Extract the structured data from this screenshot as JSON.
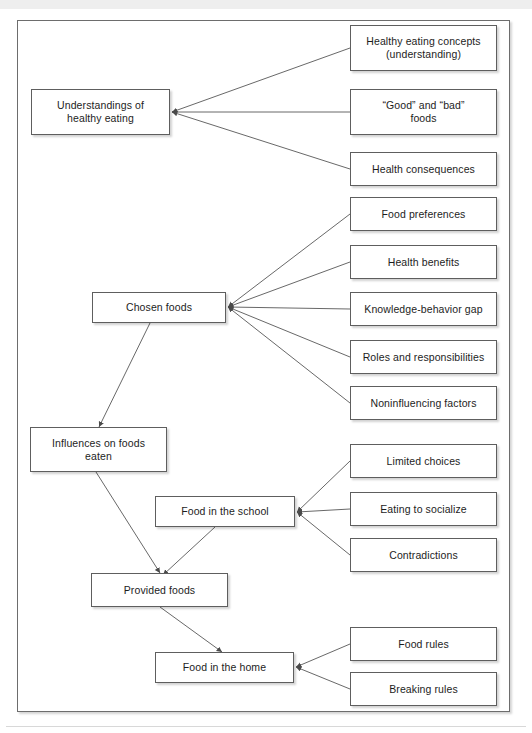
{
  "figure": {
    "type": "hierarchical-concept-map",
    "orientation": "left-parent-to-right-children",
    "arrowheads": "pointing into parent nodes",
    "nodes": [
      {
        "id": "understandings",
        "label": "Understandings of\nhealthy eating",
        "x": 31,
        "y": 89,
        "w": 139,
        "h": 46,
        "level": "theme"
      },
      {
        "id": "concepts",
        "label": "Healthy eating concepts\n(understanding)",
        "x": 350,
        "y": 25,
        "w": 147,
        "h": 46,
        "level": "subtheme"
      },
      {
        "id": "good-bad",
        "label": "“Good” and “bad”\nfoods",
        "x": 350,
        "y": 89,
        "w": 147,
        "h": 46,
        "level": "subtheme"
      },
      {
        "id": "consequences",
        "label": "Health consequences",
        "x": 350,
        "y": 152,
        "w": 147,
        "h": 34,
        "level": "subtheme"
      },
      {
        "id": "chosen-foods",
        "label": "Chosen foods",
        "x": 92,
        "y": 292,
        "w": 134,
        "h": 31,
        "level": "theme"
      },
      {
        "id": "food-preferences",
        "label": "Food preferences",
        "x": 350,
        "y": 197,
        "w": 147,
        "h": 34,
        "level": "subtheme"
      },
      {
        "id": "health-benefits",
        "label": "Health benefits",
        "x": 350,
        "y": 245,
        "w": 147,
        "h": 34,
        "level": "subtheme"
      },
      {
        "id": "knowledge-gap",
        "label": "Knowledge-behavior gap",
        "x": 350,
        "y": 292,
        "w": 147,
        "h": 34,
        "level": "subtheme"
      },
      {
        "id": "roles",
        "label": "Roles and responsibilities",
        "x": 350,
        "y": 340,
        "w": 147,
        "h": 34,
        "level": "subtheme"
      },
      {
        "id": "noninfluencing",
        "label": "Noninfluencing factors",
        "x": 350,
        "y": 386,
        "w": 147,
        "h": 34,
        "level": "subtheme"
      },
      {
        "id": "influences",
        "label": "Influences on foods\neaten",
        "x": 30,
        "y": 427,
        "w": 137,
        "h": 45,
        "level": "theme"
      },
      {
        "id": "food-school",
        "label": "Food in the school",
        "x": 155,
        "y": 496,
        "w": 140,
        "h": 31,
        "level": "theme"
      },
      {
        "id": "limited-choices",
        "label": "Limited choices",
        "x": 350,
        "y": 444,
        "w": 147,
        "h": 34,
        "level": "subtheme"
      },
      {
        "id": "socialize",
        "label": "Eating to socialize",
        "x": 350,
        "y": 492,
        "w": 147,
        "h": 34,
        "level": "subtheme"
      },
      {
        "id": "contradictions",
        "label": "Contradictions",
        "x": 350,
        "y": 538,
        "w": 147,
        "h": 34,
        "level": "subtheme"
      },
      {
        "id": "provided-foods",
        "label": "Provided foods",
        "x": 91,
        "y": 573,
        "w": 137,
        "h": 34,
        "level": "theme"
      },
      {
        "id": "food-home",
        "label": "Food in the home",
        "x": 155,
        "y": 652,
        "w": 139,
        "h": 31,
        "level": "theme"
      },
      {
        "id": "food-rules",
        "label": "Food rules",
        "x": 350,
        "y": 627,
        "w": 147,
        "h": 34,
        "level": "subtheme"
      },
      {
        "id": "breaking-rules",
        "label": "Breaking rules",
        "x": 350,
        "y": 672,
        "w": 147,
        "h": 34,
        "level": "subtheme"
      }
    ],
    "edges": [
      {
        "from": "concepts",
        "to": "understandings"
      },
      {
        "from": "good-bad",
        "to": "understandings"
      },
      {
        "from": "consequences",
        "to": "understandings"
      },
      {
        "from": "food-preferences",
        "to": "chosen-foods"
      },
      {
        "from": "health-benefits",
        "to": "chosen-foods"
      },
      {
        "from": "knowledge-gap",
        "to": "chosen-foods"
      },
      {
        "from": "roles",
        "to": "chosen-foods"
      },
      {
        "from": "noninfluencing",
        "to": "chosen-foods"
      },
      {
        "from": "chosen-foods",
        "to": "influences"
      },
      {
        "from": "limited-choices",
        "to": "food-school"
      },
      {
        "from": "socialize",
        "to": "food-school"
      },
      {
        "from": "contradictions",
        "to": "food-school"
      },
      {
        "from": "influences",
        "to": "provided-foods"
      },
      {
        "from": "food-school",
        "to": "provided-foods"
      },
      {
        "from": "food-rules",
        "to": "food-home"
      },
      {
        "from": "breaking-rules",
        "to": "food-home"
      },
      {
        "from": "provided-foods",
        "to": "food-home"
      }
    ]
  },
  "colors": {
    "frame_border": "#6d6d6d",
    "node_border": "#5e5e5e",
    "node_fill": "#ffffff",
    "edge_stroke": "#575757",
    "text": "#1d1d1d",
    "page_background": "#ffffff"
  },
  "labels": {
    "understandings": "Understandings of healthy eating",
    "concepts": "Healthy eating concepts (understanding)",
    "good_bad": "“Good” and “bad” foods",
    "consequences": "Health consequences",
    "chosen_foods": "Chosen foods",
    "food_preferences": "Food preferences",
    "health_benefits": "Health benefits",
    "knowledge_gap": "Knowledge-behavior gap",
    "roles": "Roles and responsibilities",
    "noninfluencing": "Noninfluencing factors",
    "influences": "Influences on foods eaten",
    "food_school": "Food in the school",
    "limited_choices": "Limited choices",
    "socialize": "Eating to socialize",
    "contradictions": "Contradictions",
    "provided_foods": "Provided foods",
    "food_home": "Food in the home",
    "food_rules": "Food rules",
    "breaking_rules": "Breaking rules"
  }
}
